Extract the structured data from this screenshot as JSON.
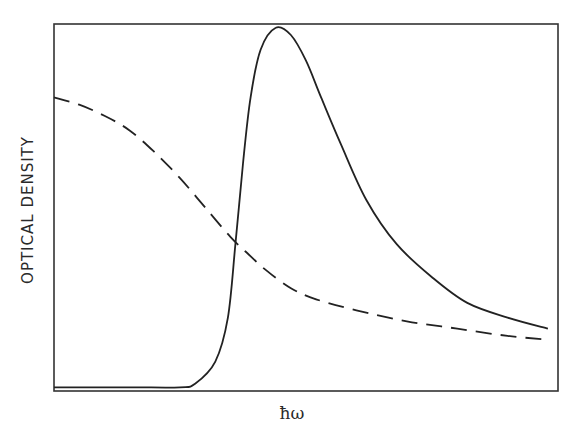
{
  "chart_data": {
    "type": "line",
    "title": "",
    "xlabel": "ħω",
    "ylabel": "OPTICAL DENSITY",
    "xlim": [
      0,
      1
    ],
    "ylim": [
      0,
      1
    ],
    "grid": false,
    "legend": null,
    "ticks": {
      "x": [],
      "y": []
    },
    "series": [
      {
        "name": "solid",
        "style": "solid",
        "x": [
          0.0,
          0.15,
          0.25,
          0.28,
          0.32,
          0.345,
          0.36,
          0.375,
          0.39,
          0.41,
          0.44,
          0.47,
          0.5,
          0.53,
          0.57,
          0.62,
          0.68,
          0.75,
          0.82,
          0.9,
          0.98
        ],
        "y": [
          0.01,
          0.01,
          0.01,
          0.02,
          0.08,
          0.2,
          0.4,
          0.62,
          0.8,
          0.93,
          0.99,
          0.97,
          0.9,
          0.8,
          0.67,
          0.52,
          0.4,
          0.31,
          0.24,
          0.2,
          0.17
        ]
      },
      {
        "name": "dashed",
        "style": "dashed",
        "x": [
          0.0,
          0.05,
          0.1,
          0.15,
          0.2,
          0.25,
          0.3,
          0.35,
          0.38,
          0.42,
          0.47,
          0.52,
          0.6,
          0.7,
          0.8,
          0.9,
          0.98
        ],
        "y": [
          0.8,
          0.78,
          0.75,
          0.71,
          0.65,
          0.58,
          0.5,
          0.42,
          0.38,
          0.33,
          0.28,
          0.25,
          0.22,
          0.19,
          0.17,
          0.15,
          0.14
        ]
      }
    ]
  },
  "axes": {
    "xlabel": "ħω",
    "ylabel": "OPTICAL DENSITY"
  },
  "colors": {
    "line": "#222222",
    "frame": "#333333",
    "background": "#ffffff"
  }
}
